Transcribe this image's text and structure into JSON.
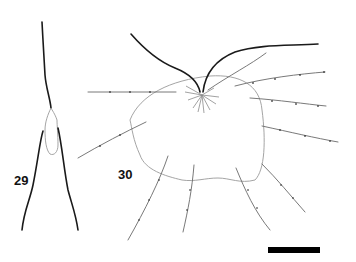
{
  "figure": {
    "panels": [
      {
        "id": "29",
        "label": "29"
      },
      {
        "id": "30",
        "label": "30"
      }
    ],
    "scale_bar": {
      "color": "#000000"
    },
    "colors": {
      "outline_thick": "#1a1a1a",
      "outline_thin": "#9a9a9a",
      "setae": "#6a6a6a"
    }
  }
}
